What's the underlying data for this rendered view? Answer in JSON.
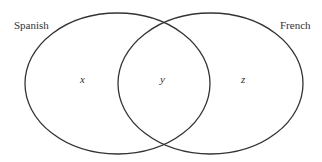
{
  "diagram": {
    "type": "venn",
    "sets": [
      {
        "label": "Spanish",
        "region_label": "x"
      },
      {
        "label": "French",
        "region_label": "z"
      }
    ],
    "intersection_label": "y",
    "stroke_color": "#333333",
    "background": "#ffffff"
  }
}
